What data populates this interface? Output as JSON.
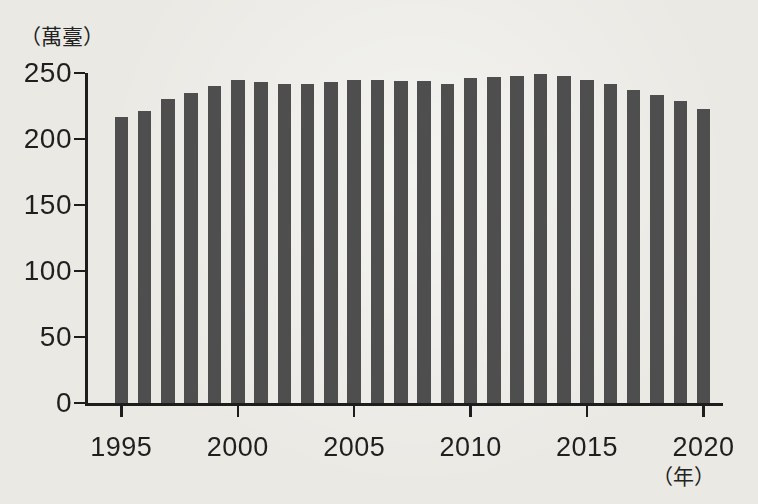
{
  "page": {
    "background_color": "#eae9e4",
    "text_color": "#1f1f1f"
  },
  "chart_data": {
    "type": "bar",
    "title": "",
    "y_unit_label": "（萬臺）",
    "x_unit_label": "（年）",
    "categories": [
      1995,
      1996,
      1997,
      1998,
      1999,
      2000,
      2001,
      2002,
      2003,
      2004,
      2005,
      2006,
      2007,
      2008,
      2009,
      2010,
      2011,
      2012,
      2013,
      2014,
      2015,
      2016,
      2017,
      2018,
      2019,
      2020
    ],
    "values": [
      217,
      221,
      230,
      235,
      240,
      245,
      243,
      242,
      242,
      243,
      245,
      245,
      244,
      244,
      242,
      246,
      247,
      248,
      249,
      248,
      245,
      242,
      237,
      233,
      229,
      223
    ],
    "x_tick_labels": [
      "1995",
      "2000",
      "2005",
      "2010",
      "2015",
      "2020"
    ],
    "x_tick_years": [
      1995,
      2000,
      2005,
      2010,
      2015,
      2020
    ],
    "y_tick_labels": [
      "0",
      "50",
      "100",
      "150",
      "200",
      "250"
    ],
    "y_ticks": [
      0,
      50,
      100,
      150,
      200,
      250
    ],
    "ylim": [
      0,
      250
    ],
    "grid": false,
    "legend": "none",
    "bar_color": "#4e4e4e",
    "axis_color": "#1d1d1d"
  }
}
